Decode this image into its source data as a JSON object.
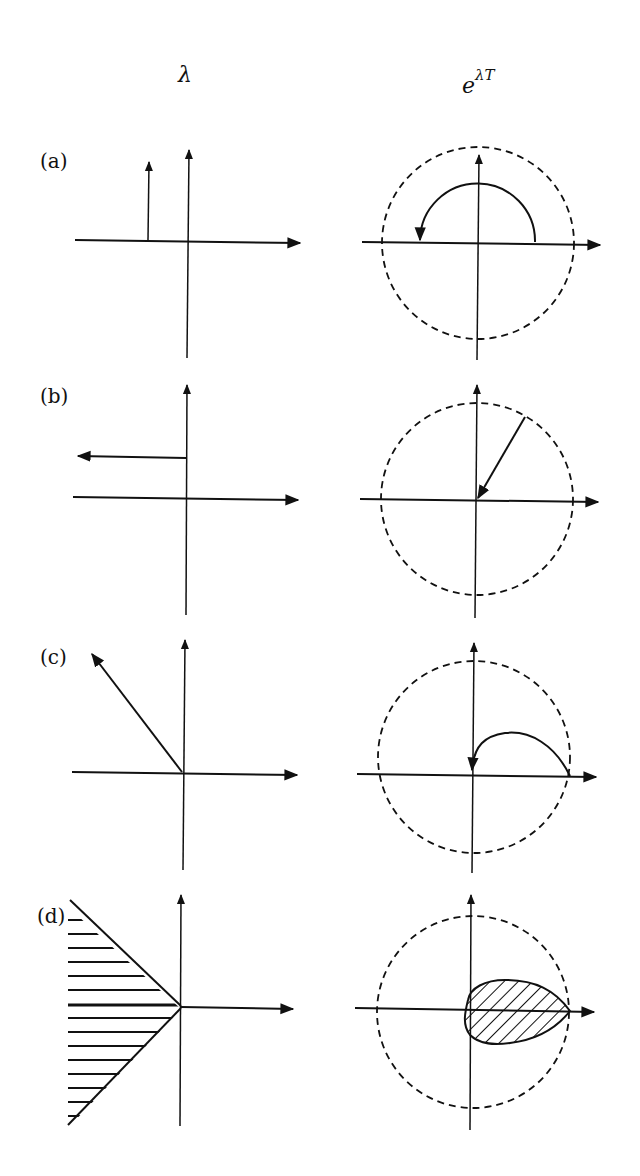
{
  "figure": {
    "column_titles": {
      "left": "λ",
      "right_base": "e",
      "right_sup": "λT"
    },
    "rows": [
      {
        "label": "(a)",
        "description": "Purely imaginary eigenvalue with negative real part fixed; image rotates around unit circle"
      },
      {
        "label": "(b)",
        "description": "Eigenvalue moving left along a horizontal line; image moves radially inward"
      },
      {
        "label": "(c)",
        "description": "Eigenvalue along a ray at 135°; image spirals into origin"
      },
      {
        "label": "(d)",
        "description": "Sector of left half-plane maps into a teardrop region inside the unit circle"
      }
    ],
    "colors": {
      "ink": "#111111",
      "background": "#ffffff"
    },
    "layout": {
      "left_origin_x": [
        188,
        187,
        184,
        181
      ],
      "right_origin_x": [
        478,
        476,
        474,
        471
      ],
      "origin_y": [
        242,
        499,
        773,
        1009
      ],
      "circle_radius": 96
    }
  }
}
